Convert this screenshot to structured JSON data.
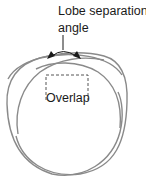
{
  "diagram": {
    "title_lines": [
      "Lobe separation",
      "angle"
    ],
    "overlap_label": "Overlap",
    "colors": {
      "curve": "#8a8a8a",
      "text": "#1a1a1a",
      "arrow": "#1a1a1a",
      "dashed_box": "#555555",
      "background": "#ffffff"
    },
    "elements": [
      {
        "type": "lobe-curve",
        "name": "left-lobe"
      },
      {
        "type": "lobe-curve",
        "name": "right-lobe"
      },
      {
        "type": "arc-arrow",
        "name": "lobe-separation-angle-indicator"
      },
      {
        "type": "leader-line",
        "name": "angle-pointer"
      },
      {
        "type": "dashed-box",
        "name": "overlap-region"
      }
    ]
  }
}
